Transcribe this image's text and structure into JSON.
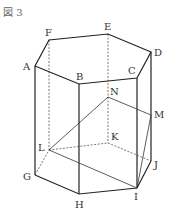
{
  "caption": "図 3",
  "labels": {
    "A": "A",
    "B": "B",
    "C": "C",
    "D": "D",
    "E": "E",
    "F": "F",
    "G": "G",
    "H": "H",
    "I": "I",
    "J": "J",
    "K": "K",
    "L": "L",
    "M": "M",
    "N": "N"
  },
  "figure": {
    "type": "regular hexagonal prism",
    "top_face": [
      "A",
      "B",
      "C",
      "D",
      "E",
      "F"
    ],
    "bottom_face": [
      "G",
      "H",
      "I",
      "J",
      "K",
      "L"
    ],
    "points_on_edges": {
      "M": "DJ",
      "N": "EK"
    },
    "triangle_segments": [
      "LN",
      "NM",
      "MI",
      "IL"
    ]
  }
}
